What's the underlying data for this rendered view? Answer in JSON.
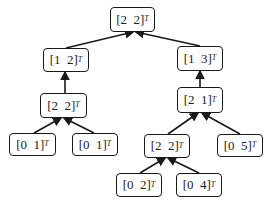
{
  "diagram": {
    "type": "tree",
    "edge_direction": "child-to-parent",
    "transpose_symbol": "T",
    "nodes": [
      {
        "id": "n0",
        "label": "[2  2]",
        "parent": null
      },
      {
        "id": "n1",
        "label": "[1  2]",
        "parent": "n0"
      },
      {
        "id": "n2",
        "label": "[1  3]",
        "parent": "n0"
      },
      {
        "id": "n3",
        "label": "[2  2]",
        "parent": "n1"
      },
      {
        "id": "n4",
        "label": "[2  1]",
        "parent": "n2"
      },
      {
        "id": "n5",
        "label": "[0  1]",
        "parent": "n3"
      },
      {
        "id": "n6",
        "label": "[0  1]",
        "parent": "n3"
      },
      {
        "id": "n7",
        "label": "[2  2]",
        "parent": "n4"
      },
      {
        "id": "n8",
        "label": "[0  5]",
        "parent": "n4"
      },
      {
        "id": "n9",
        "label": "[0  2]",
        "parent": "n7"
      },
      {
        "id": "n10",
        "label": "[0  4]",
        "parent": "n7"
      }
    ]
  }
}
